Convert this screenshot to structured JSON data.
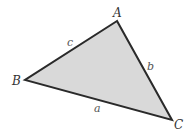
{
  "diagram": {
    "type": "triangle",
    "fill_color": "#d9d9d9",
    "stroke_color": "#2a2a2a",
    "vertices": [
      {
        "name": "A",
        "x": 117,
        "y": 21,
        "label_x": 113,
        "label_y": 17
      },
      {
        "name": "B",
        "x": 25,
        "y": 80,
        "label_x": 12,
        "label_y": 85
      },
      {
        "name": "C",
        "x": 172,
        "y": 120,
        "label_x": 174,
        "label_y": 129
      }
    ],
    "sides": [
      {
        "name": "a",
        "between": "B-C",
        "label_x": 94,
        "label_y": 112
      },
      {
        "name": "b",
        "between": "A-C",
        "label_x": 147,
        "label_y": 70
      },
      {
        "name": "c",
        "between": "A-B",
        "label_x": 67,
        "label_y": 46
      }
    ]
  }
}
